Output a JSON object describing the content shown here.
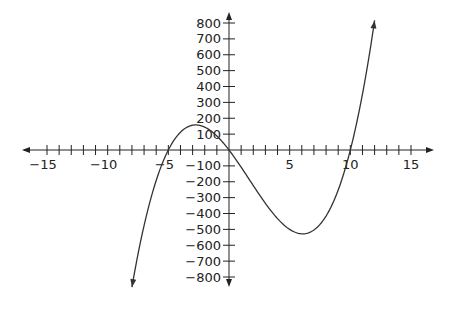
{
  "chart_data": {
    "type": "line",
    "title": "",
    "xlabel": "",
    "ylabel": "",
    "function": "f(x) = 2x(x+5)(x-10)",
    "xlim": [
      -17,
      17
    ],
    "ylim": [
      -850,
      850
    ],
    "grid": false,
    "legend": null,
    "x_ticks": [
      -15,
      -10,
      -5,
      5,
      10,
      15
    ],
    "y_ticks": [
      800,
      700,
      600,
      500,
      400,
      300,
      200,
      100,
      -100,
      -200,
      -300,
      -400,
      -500,
      -600,
      -700,
      -800
    ],
    "x_minor_step": 1,
    "series": [
      {
        "name": "curve",
        "x": [
          -8,
          -7,
          -6,
          -5,
          -4,
          -3,
          -2.74,
          -2,
          -1,
          0,
          1,
          2,
          3,
          4,
          5,
          6,
          6.08,
          7,
          8,
          9,
          10,
          11,
          12
        ],
        "y": [
          -864,
          -560,
          -288,
          0,
          112,
          156,
          158,
          144,
          88,
          0,
          -108,
          -224,
          -336,
          -432,
          -500,
          -528,
          -528,
          -504,
          -416,
          -252,
          0,
          352,
          816
        ]
      }
    ],
    "colors": {
      "axis": "#222222",
      "curve": "#333333"
    }
  }
}
